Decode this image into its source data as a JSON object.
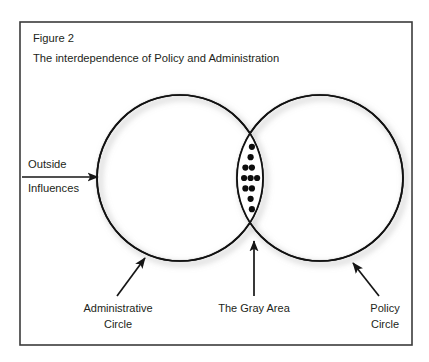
{
  "figure": {
    "title_number": "Figure 2",
    "title_text": "The interdependence of Policy and Administration",
    "frame": {
      "x": 20,
      "y": 22,
      "width": 392,
      "height": 323,
      "stroke_color": "#3b3b3b",
      "stroke_width": 1.6
    },
    "background_color": "#ffffff",
    "text_color": "#231f20"
  },
  "diagram": {
    "type": "venn-2-circle",
    "circle_stroke_color": "#111111",
    "circle_stroke_width": 1.7,
    "shadow_color": "#cfcfcf",
    "left_circle": {
      "label_line1": "Administrative",
      "label_line2": "Circle",
      "cx": 180,
      "cy": 178,
      "r": 83
    },
    "right_circle": {
      "label_line1": "Policy",
      "label_line2": "Circle",
      "cx": 320,
      "cy": 178,
      "r": 83
    },
    "intersection": {
      "label": "The Gray Area",
      "dot_color": "#0d0d0d",
      "dot_radius": 3.1,
      "dot_count": 36
    },
    "input_arrow": {
      "label_line1": "Outside",
      "label_line2": "Influences",
      "x1": 22,
      "y1": 177,
      "x2": 100,
      "y2": 177
    }
  },
  "annotations": [
    {
      "name": "administrative-circle-callout",
      "lines": [
        "Administrative",
        "Circle"
      ],
      "text_x": 118,
      "text_y": 309,
      "anchor": "middle",
      "arrow_from_x": 117,
      "arrow_from_y": 296,
      "arrow_to_x": 146,
      "arrow_to_y": 257
    },
    {
      "name": "gray-area-callout",
      "lines": [
        "The Gray Area"
      ],
      "text_x": 254,
      "text_y": 309,
      "anchor": "middle",
      "arrow_from_x": 254,
      "arrow_from_y": 296,
      "arrow_to_x": 254,
      "arrow_to_y": 239
    },
    {
      "name": "policy-circle-callout",
      "lines": [
        "Policy",
        "Circle"
      ],
      "text_x": 385,
      "text_y": 309,
      "anchor": "middle",
      "arrow_from_x": 379,
      "arrow_from_y": 296,
      "arrow_to_x": 352,
      "arrow_to_y": 262
    }
  ]
}
